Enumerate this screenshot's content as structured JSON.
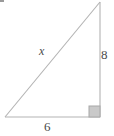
{
  "figure": {
    "type": "right-triangle-diagram",
    "stroke_color": "#b3b3b3",
    "label_color": "#4a4a4a",
    "right_angle_fill": "#c9c9c9",
    "right_angle_stroke": "#a8a8a8",
    "background_color": "#ffffff",
    "vertices": {
      "apex": [
        100,
        2
      ],
      "right_angle": [
        100,
        117
      ],
      "bottom_left": [
        5,
        117
      ]
    },
    "labels": {
      "hypotenuse": "x",
      "vertical_leg": "8",
      "horizontal_leg": "6"
    },
    "right_angle_marker": {
      "x": 89,
      "y": 106,
      "size": 11
    }
  }
}
